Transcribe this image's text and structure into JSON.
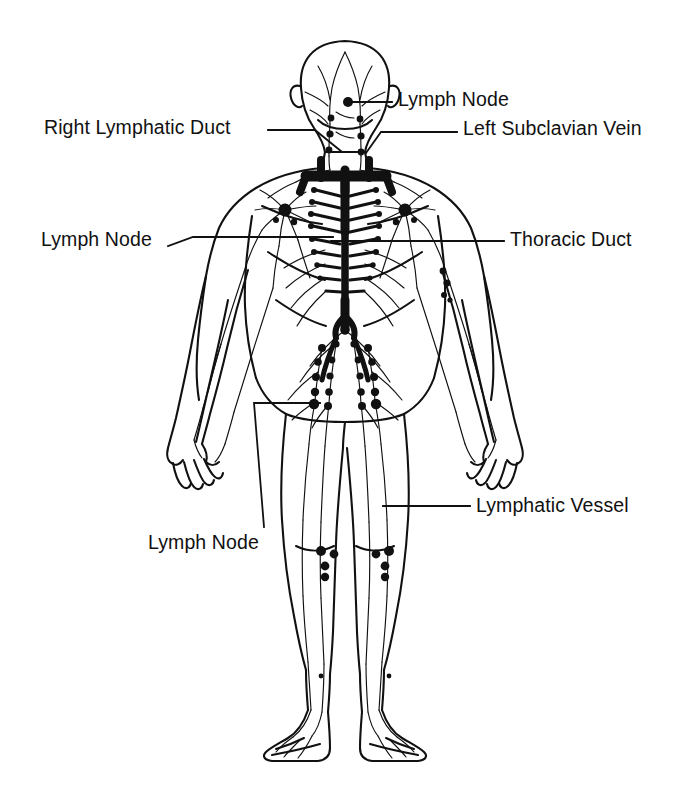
{
  "figure": {
    "background_color": "#ffffff",
    "ink_color": "#111111",
    "width": 690,
    "height": 797
  },
  "labels": [
    {
      "id": "lymph-node-neck",
      "text": "Lymph Node",
      "x": 398,
      "y": 90,
      "align": "left",
      "leader": "M348,102 L392,102"
    },
    {
      "id": "right-lymphatic-duct",
      "text": "Right Lymphatic Duct",
      "x": 44,
      "y": 118,
      "align": "left",
      "leader": "M268,130 L315,130 L342,152"
    },
    {
      "id": "left-subclavian-vein",
      "text": "Left Subclavian Vein",
      "x": 463,
      "y": 119,
      "align": "left",
      "leader": "M366,153 L381,132 L457,132"
    },
    {
      "id": "thoracic-duct",
      "text": "Thoracic Duct",
      "x": 510,
      "y": 230,
      "align": "left",
      "leader": "M331,241 L504,241"
    },
    {
      "id": "lymph-node-axillary",
      "text": "Lymph Node",
      "x": 41,
      "y": 230,
      "align": "left",
      "leader": "M168,246 L193,237 L333,237"
    },
    {
      "id": "lymph-node-inguinal",
      "text": "Lymph Node",
      "x": 148,
      "y": 533,
      "align": "left",
      "leader": "M264,527 L254,403 L320,403"
    },
    {
      "id": "lymphatic-vessel",
      "text": "Lymphatic Vessel",
      "x": 476,
      "y": 496,
      "align": "left",
      "leader": "M383,506 L470,506"
    }
  ]
}
